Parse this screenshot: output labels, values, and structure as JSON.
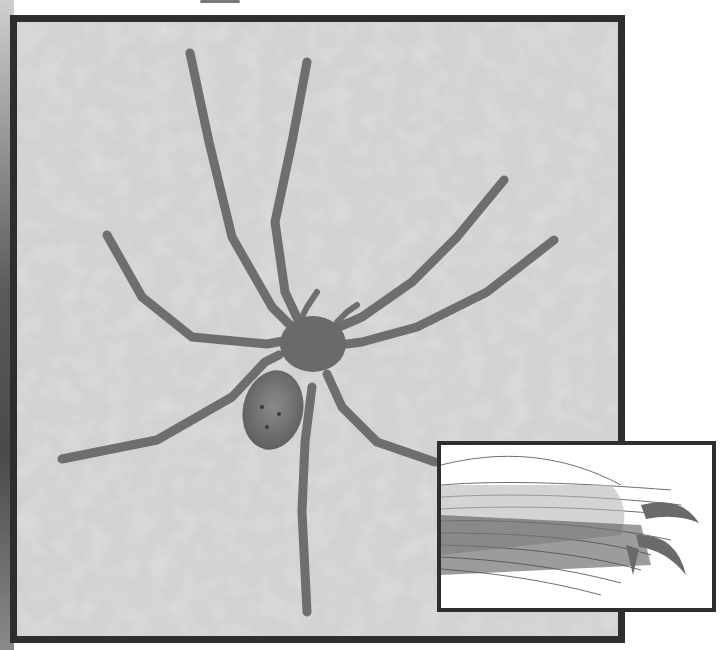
{
  "image": {
    "subject": "Huntsman spider on textured wall",
    "inset_subject": "Magnified tarsal claws with claw tufts",
    "tone": "grayscale",
    "colors": {
      "frame": "#2e2e2e",
      "wall": "#cfcfcf",
      "spider": "#6a6a6a",
      "inset_background": "#ffffff"
    }
  }
}
